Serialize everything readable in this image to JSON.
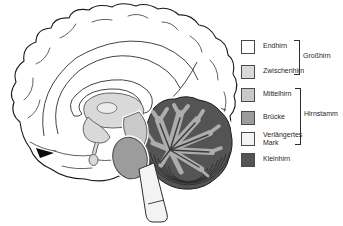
{
  "figure": {
    "type": "sagittal brain section diagram",
    "background": "#ffffff",
    "outline_color": "#1a1a1a",
    "arbor_color": "#adadad",
    "folia_color": "#2d2d2d"
  },
  "legend": {
    "items": [
      {
        "id": "endhirn",
        "label": "Endhirn",
        "color": "#ffffff"
      },
      {
        "id": "zwischenhirn",
        "label": "Zwischenhirn",
        "color": "#d9d9d9"
      },
      {
        "id": "mittelhirn",
        "label": "Mittelhirn",
        "color": "#c9c9c9"
      },
      {
        "id": "bruecke",
        "label": "Brücke",
        "color": "#9c9c9c"
      },
      {
        "id": "verlaengertes-mark",
        "label": "Verlängertes Mark",
        "color": "#f3f3f3"
      },
      {
        "id": "kleinhirn",
        "label": "Kleinhirn",
        "color": "#545454"
      }
    ],
    "groups": [
      {
        "id": "grosshirn",
        "label": "Großhirn",
        "covers": [
          "Endhirn",
          "Zwischenhirn"
        ]
      },
      {
        "id": "hirnstamm",
        "label": "Hirnstamm",
        "covers": [
          "Mittelhirn",
          "Brücke",
          "Verlängertes Mark"
        ]
      }
    ]
  }
}
